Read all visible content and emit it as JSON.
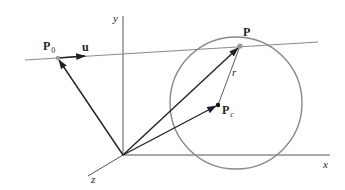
{
  "figure": {
    "labels": {
      "y_axis": "y",
      "x_axis": "x",
      "z_axis": "z",
      "P0_main": "P",
      "P0_sub": "0",
      "u": "u",
      "P": "P",
      "r": "r",
      "Pc_main": "P",
      "Pc_sub": "c"
    },
    "colors": {
      "axis": "#444444",
      "vector": "#222222",
      "circle": "#888888",
      "line": "#888888",
      "point_gray": "#999999",
      "point_black": "#111111"
    }
  }
}
